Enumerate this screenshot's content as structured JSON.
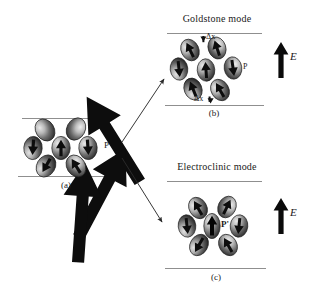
{
  "figure": {
    "type": "scientific-schematic",
    "background_color": "#ffffff",
    "line_color": "#8a8a8a",
    "arrow_color": "#1a1a1a",
    "molecule_dark": "#3a3a3a",
    "molecule_light": "#d8d8d8"
  },
  "panels": {
    "a": {
      "caption": "(a)",
      "polarization_label": "P",
      "title": "",
      "molecule_count": 7,
      "arrangement": "ring-of-six-plus-center",
      "boundary_lines": 2
    },
    "b": {
      "caption": "(b)",
      "title": "Goldstone mode",
      "polarization_label": "P",
      "field_label": "E",
      "displacement_label_top": "Δx",
      "displacement_label_bottom": "Δx",
      "molecule_count": 7,
      "arrangement": "tilted-diamond",
      "boundary_lines": 2
    },
    "c": {
      "caption": "(c)",
      "title": "Electroclinic mode",
      "polarization_label": "P'",
      "field_label": "E",
      "molecule_count": 7,
      "arrangement": "ring-of-six-plus-center",
      "boundary_lines": 2
    }
  },
  "connectors": [
    {
      "from": "a",
      "to": "b",
      "style": "thin-arrow-up-right"
    },
    {
      "from": "a",
      "to": "c",
      "style": "thin-arrow-down-right"
    }
  ]
}
